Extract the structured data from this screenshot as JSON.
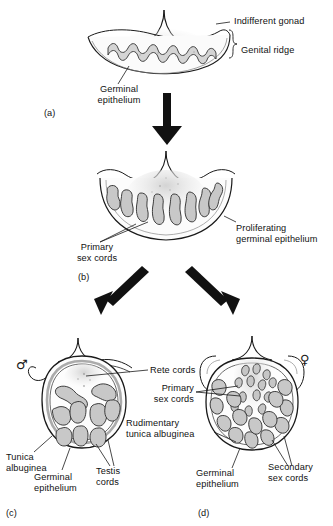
{
  "figure": {
    "type": "biological-diagram",
    "background_color": "#ffffff",
    "line_color": "#1a1a1a",
    "cord_fill_color": "#c8c8c8",
    "stroke_color": "#2b2b2b"
  },
  "panels": [
    {
      "id": "a",
      "letter": "(a)",
      "stage": "Indifferent gonad",
      "labels": [
        {
          "name": "indifferent-gonad",
          "text": "Indifferent gonad"
        },
        {
          "name": "genital-ridge",
          "text": "Genital ridge"
        },
        {
          "name": "germinal-epithelium",
          "text": "Germinal\nepithelium"
        }
      ]
    },
    {
      "id": "b",
      "letter": "(b)",
      "stage": "Proliferating gonad",
      "labels": [
        {
          "name": "primary-sex-cords",
          "text": "Primary\nsex cords"
        },
        {
          "name": "proliferating-germinal-epithelium",
          "text": "Proliferating\ngerminal epithelium"
        }
      ]
    },
    {
      "id": "c",
      "letter": "(c)",
      "stage": "Testis",
      "symbol": "♂",
      "symbol_name": "male-symbol",
      "labels": [
        {
          "name": "tunica-albuginea",
          "text": "Tunica\nalbuginea"
        },
        {
          "name": "germinal-epithelium",
          "text": "Germinal\nepithelium"
        },
        {
          "name": "testis-cords",
          "text": "Testis\ncords"
        }
      ]
    },
    {
      "id": "d",
      "letter": "(d)",
      "stage": "Ovary",
      "symbol": "♀",
      "symbol_name": "female-symbol",
      "labels": [
        {
          "name": "rudimentary-tunica-albuginea",
          "text": "Rudimentary\ntunica albuginea"
        },
        {
          "name": "germinal-epithelium",
          "text": "Germinal\nepithelium"
        },
        {
          "name": "secondary-sex-cords",
          "text": "Secondary\nsex cords"
        }
      ]
    }
  ],
  "shared_labels": [
    {
      "name": "rete-cords",
      "text": "Rete cords"
    },
    {
      "name": "primary-sex-cords",
      "text": "Primary\nsex cords"
    }
  ],
  "arrows": [
    {
      "name": "arrow-a-to-b",
      "direction": "down"
    },
    {
      "name": "arrow-b-to-c",
      "direction": "down-left"
    },
    {
      "name": "arrow-b-to-d",
      "direction": "down-right"
    }
  ],
  "text": {
    "a_letter": "(a)",
    "b_letter": "(b)",
    "c_letter": "(c)",
    "d_letter": "(d)",
    "indifferent_gonad": "Indifferent gonad",
    "genital_ridge": "Genital ridge",
    "germinal_epithelium_a": "Germinal\nepithelium",
    "primary_sex_cords_b": "Primary\nsex cords",
    "proliferating_germinal_epithelium": "Proliferating\ngerminal epithelium",
    "rete_cords": "Rete cords",
    "primary_sex_cords_d": "Primary\nsex cords",
    "rudimentary_tunica_albuginea": "Rudimentary\ntunica albuginea",
    "tunica_albuginea": "Tunica\nalbuginea",
    "germinal_epithelium_c": "Germinal\nepithelium",
    "testis_cords": "Testis\ncords",
    "germinal_epithelium_d": "Germinal\nepithelium",
    "secondary_sex_cords": "Secondary\nsex cords",
    "male_symbol": "♂",
    "female_symbol": "♀"
  }
}
